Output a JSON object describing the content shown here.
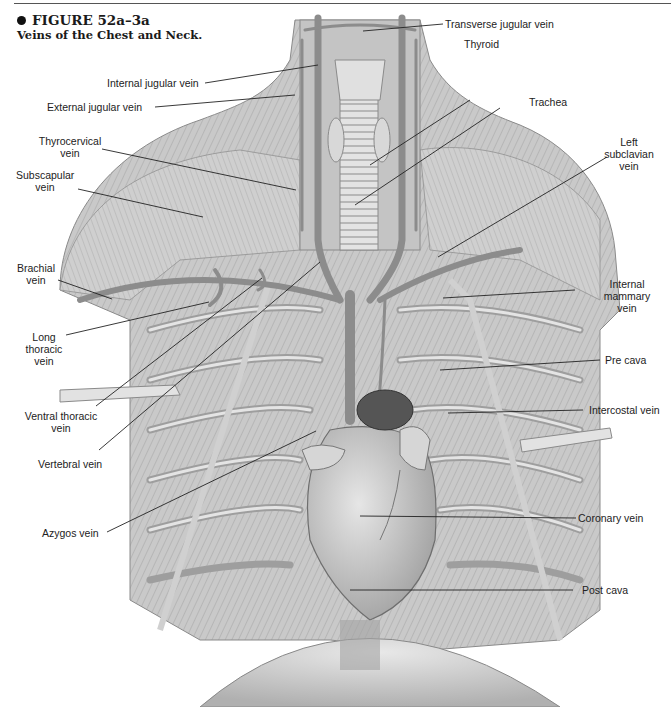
{
  "figure": {
    "number": "FIGURE 52a–3a",
    "title": "Veins of the Chest and Neck.",
    "bullet_icon": "filled-circle"
  },
  "labels": {
    "transverse_jugular": "Transverse jugular vein",
    "internal_jugular": "Internal jugular vein",
    "external_jugular": "External jugular vein",
    "thyroid": "Thyroid",
    "trachea": "Trachea",
    "thyrocervical_1": "Thyrocervical",
    "thyrocervical_2": "vein",
    "subscapular_1": "Subscapular",
    "subscapular_2": "vein",
    "left_subclavian_1": "Left",
    "left_subclavian_2": "subclavian",
    "left_subclavian_3": "vein",
    "brachial_1": "Brachial",
    "brachial_2": "vein",
    "internal_mammary_1": "Internal",
    "internal_mammary_2": "mammary",
    "internal_mammary_3": "vein",
    "long_thoracic_1": "Long",
    "long_thoracic_2": "thoracic",
    "long_thoracic_3": "vein",
    "pre_cava": "Pre cava",
    "ventral_thoracic_1": "Ventral thoracic",
    "ventral_thoracic_2": "vein",
    "intercostal": "Intercostal vein",
    "vertebral": "Vertebral vein",
    "azygos": "Azygos vein",
    "coronary": "Coronary vein",
    "post_cava": "Post cava"
  },
  "colors": {
    "text": "#222222",
    "leader": "#222222",
    "tissue_light": "#d9d9d9",
    "tissue_mid": "#b5b5b5",
    "tissue_dark": "#7a7a7a",
    "vessel": "#8c8c8c"
  }
}
